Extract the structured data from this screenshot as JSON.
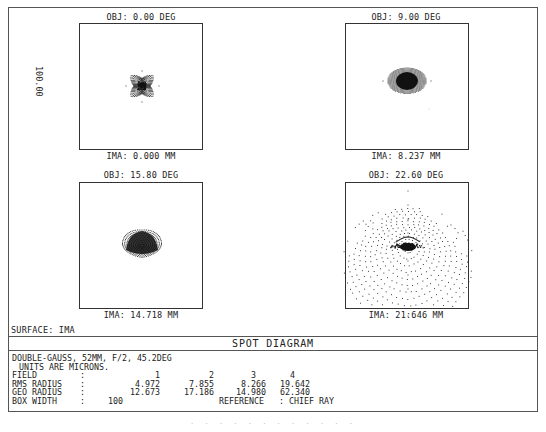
{
  "surface_label": "SURFACE: IMA",
  "title": "SPOT DIAGRAM",
  "scale_label": "100.00",
  "description": {
    "lens": "DOUBLE-GAUSS, 52MM, F/2, 45.2DEG",
    "units": "UNITS ARE MICRONS."
  },
  "table": {
    "field_label": "FIELD",
    "rms_label": "RMS RADIUS",
    "geo_label": "GEO RADIUS",
    "box_label": "BOX WIDTH",
    "sep": ":",
    "fields": [
      "1",
      "2",
      "3",
      "4"
    ],
    "rms": [
      "4.972",
      "7.855",
      "8.266",
      "19.642"
    ],
    "geo": [
      "12.673",
      "17.186",
      "14.980",
      "62.340"
    ],
    "box_width": "100",
    "reference": "REFERENCE   : CHIEF RAY"
  },
  "chart_data": {
    "type": "scatter",
    "title": "SPOT DIAGRAM",
    "subtitle": "DOUBLE-GAUSS, 52MM, F/2, 45.2DEG",
    "units": "microns",
    "box_width": 100,
    "reference": "CHIEF RAY",
    "surface": "IMA",
    "panels": [
      {
        "field": 1,
        "obj": "OBJ: 0.00 DEG",
        "ima": "IMA: 0.000 MM",
        "rms_radius": 4.972,
        "geo_radius": 12.673,
        "shape": "star"
      },
      {
        "field": 2,
        "obj": "OBJ: 9.00 DEG",
        "ima": "IMA: 8.237 MM",
        "rms_radius": 7.855,
        "geo_radius": 17.186,
        "shape": "ellipse"
      },
      {
        "field": 3,
        "obj": "OBJ: 15.80 DEG",
        "ima": "IMA: 14.718 MM",
        "rms_radius": 8.266,
        "geo_radius": 14.98,
        "shape": "dome"
      },
      {
        "field": 4,
        "obj": "OBJ: 22.60 DEG",
        "ima": "IMA: 21:646 MM",
        "rms_radius": 19.642,
        "geo_radius": 62.34,
        "shape": "coma-triangle"
      }
    ],
    "xlabel": "",
    "ylabel": "100.00",
    "grid": false,
    "legend": "none"
  },
  "caption": "· · · · · · · · · · · ·"
}
